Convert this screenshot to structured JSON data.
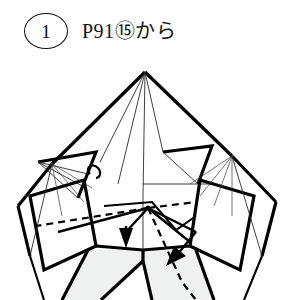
{
  "header": {
    "step_number": "1",
    "caption": "P91⓪から",
    "caption_full": "P91⑧⑧から",
    "caption_text": "P91⑮から",
    "reference_page": "P91",
    "reference_step": "⑮",
    "particle": "から"
  },
  "figure": {
    "colors": {
      "ink": "#000000",
      "crease": "#2a2a2a",
      "shaded_facet": "#eef1f0",
      "background": "#ffffff"
    },
    "annotations": [
      {
        "name": "valley-fold-left",
        "style": "dashed",
        "meaning": "valley fold line running left from center vertex"
      },
      {
        "name": "valley-fold-right",
        "style": "dashed",
        "meaning": "valley fold line running right-down from center vertex"
      },
      {
        "name": "fold-arrow-left",
        "style": "solid-arrow",
        "direction": "down",
        "meaning": "fold this flap downward"
      },
      {
        "name": "fold-arrow-right",
        "style": "solid-arrow",
        "direction": "down-left",
        "meaning": "fold this flap down and to the left"
      }
    ]
  }
}
